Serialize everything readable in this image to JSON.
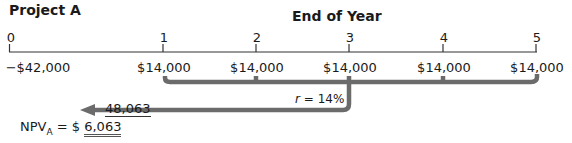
{
  "title": "Project A",
  "axis_label": "End of Year",
  "years": [
    "0",
    "1",
    "2",
    "3",
    "4",
    "5"
  ],
  "cash_flows": [
    "−$42,000",
    "$14,000",
    "$14,000",
    "$14,000",
    "$14,000",
    "$14,000"
  ],
  "rate_label": "= 14%",
  "rate_symbol": "r",
  "pv_value": "48,063",
  "npv_label": "NPV",
  "npv_subscript": "A",
  "npv_eq": " = $ ",
  "npv_value": "6,063",
  "colors": {
    "bracket": "#6b6b6b",
    "text": "#1a1a1a"
  }
}
